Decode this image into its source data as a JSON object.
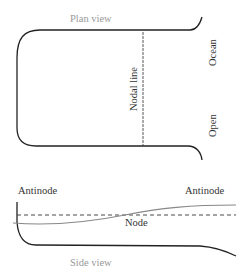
{
  "plan_view": {
    "title": "Plan view",
    "nodal_line_label": "Nodal line",
    "open_label": "Open",
    "ocean_label": "Ocean"
  },
  "side_view": {
    "title": "Side view",
    "antinode_left_label": "Antinode",
    "antinode_right_label": "Antinode",
    "node_label": "Node"
  },
  "colors": {
    "outline": "#222222",
    "water_surface": "#888888",
    "label_dark": "#333333",
    "label_light": "#999999"
  }
}
